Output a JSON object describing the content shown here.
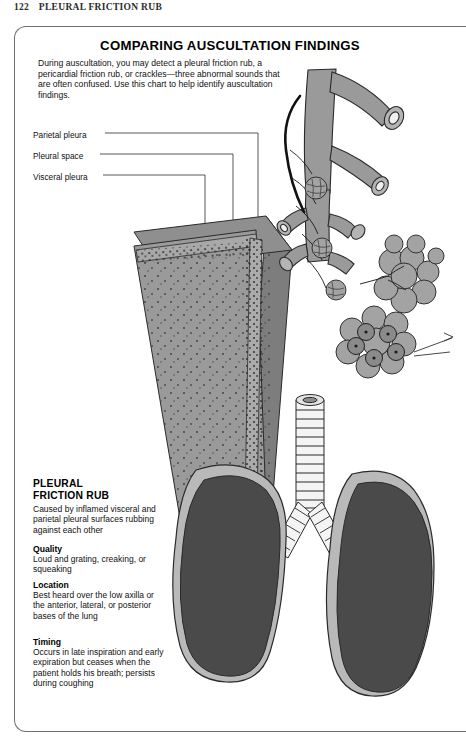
{
  "running_head": {
    "page_number": "122",
    "title": "PLEURAL FRICTION RUB"
  },
  "chart": {
    "title": "COMPARING AUSCULTATION FINDINGS",
    "intro": "During auscultation, you may detect a pleural friction rub, a pericardial friction rub, or crackles—three abnormal sounds that are often confused. Use this chart to help identify auscultation findings."
  },
  "callouts": [
    {
      "id": "parietal-pleura",
      "label": "Parietal pleura"
    },
    {
      "id": "pleural-space",
      "label": "Pleural space"
    },
    {
      "id": "visceral-pleura",
      "label": "Visceral pleura"
    }
  ],
  "section": {
    "heading": "PLEURAL\nFRICTION RUB",
    "heading_line1": "PLEURAL",
    "heading_line2": "FRICTION RUB",
    "lead": "Caused by inflamed visceral and parietal pleural surfaces rubbing against each other",
    "items": [
      {
        "label": "Quality",
        "text": "Loud and grating, creaking, or squeaking"
      },
      {
        "label": "Location",
        "text": "Best heard over the low axilla or the anterior, lateral, or posterior bases of the lung"
      },
      {
        "label": "Timing",
        "text": "Occurs in late inspiration and early expiration but ceases when the patient holds his breath; persists during coughing"
      }
    ]
  },
  "illustration": {
    "name": "pleura-lung-anatomy-diagram",
    "parts": [
      "pleural-wall-block",
      "bronchial-tree",
      "alveoli-cluster",
      "alveoli-cross-section",
      "trachea",
      "left-lung",
      "right-lung",
      "rib-inset-detail"
    ]
  },
  "colors": {
    "frame_border": "#6f6f6f",
    "mid_gray": "#9a9a9a",
    "light_gray": "#b9b9b9",
    "dark_gray": "#4a4a4a",
    "shadow_gray": "#7d7d7d",
    "outline": "#2a2a2a",
    "inset_black": "#101010"
  }
}
